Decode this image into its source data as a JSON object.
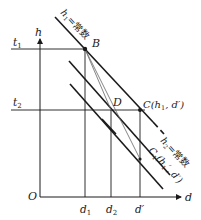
{
  "diagram": {
    "axes": {
      "origin_label": "O",
      "x_label": "d",
      "y_label": "h"
    },
    "horizontal_lines": [
      {
        "label": "t",
        "subscript": "1"
      },
      {
        "label": "t",
        "subscript": "2"
      }
    ],
    "x_ticks": [
      {
        "label": "d",
        "subscript": "1"
      },
      {
        "label": "d",
        "subscript": "2"
      },
      {
        "label": "d′",
        "subscript": ""
      }
    ],
    "points": {
      "B": "B",
      "D": "D",
      "C_label": "C(h",
      "C_sub": "1",
      "C_tail": ", d′)",
      "C1_label": "C",
      "C1_sub": "1",
      "C1_mid": "(h",
      "C1_sub2": "1",
      "C1_tail": "′, d′)"
    },
    "line_labels": {
      "h1": {
        "var": "h",
        "sub": "1",
        "text": "=常数"
      },
      "h2": {
        "var": "h",
        "sub": "2",
        "text": "=常数"
      }
    },
    "colors": {
      "line": "#1a1a1a",
      "thin_line": "#555555",
      "background": "#ffffff"
    }
  }
}
